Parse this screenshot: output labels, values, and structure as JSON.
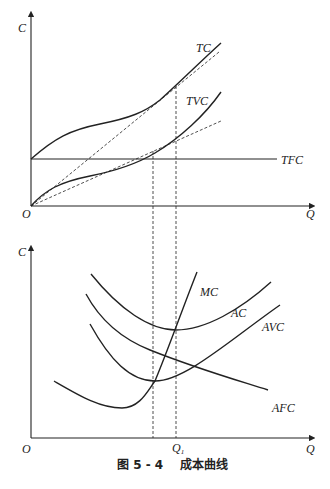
{
  "figure": {
    "caption": "图 5 - 4    成本曲线",
    "top_panel": {
      "y_axis_label": "C",
      "x_axis_label": "Q",
      "origin_label": "O",
      "curves": {
        "tc": "TC",
        "tvc": "TVC",
        "tfc": "TFC"
      }
    },
    "bottom_panel": {
      "y_axis_label": "C",
      "x_axis_label": "Q",
      "origin_label": "O",
      "q1_label": "Q",
      "q1_sub": "1",
      "curves": {
        "mc": "MC",
        "ac": "AC",
        "avc": "AVC",
        "afc": "AFC"
      }
    }
  },
  "colors": {
    "line": "#222222",
    "background": "#ffffff"
  }
}
